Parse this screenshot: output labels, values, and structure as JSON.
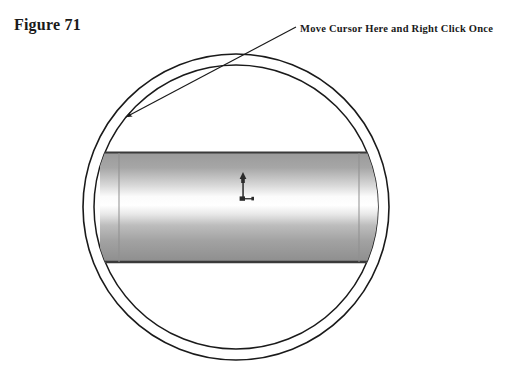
{
  "figure": {
    "label": "Figure 71"
  },
  "annotation": {
    "callout_text": "Move Cursor Here and Right Click Once",
    "arrow_target_x": 124,
    "arrow_target_y": 118,
    "arrow_origin_x": 296,
    "arrow_origin_y": 27
  },
  "drawing": {
    "title": "Pipe end view with cylinder body and CAD cursor",
    "background_color": "#ffffff",
    "line_color": "#1a1a1a",
    "annulus": {
      "name": "pipe-ring",
      "center_x": 236,
      "center_y": 207,
      "outer_radius": 153,
      "inner_radius": 142,
      "stroke_width": 1.6,
      "fill": "#ffffff"
    },
    "cylinder": {
      "name": "pipe-body",
      "left": 118,
      "right": 360,
      "top": 152,
      "bottom": 263,
      "edge_color": "#3a3a3a",
      "gradient_stops": [
        {
          "offset": "0%",
          "color": "#9a9a9a"
        },
        {
          "offset": "14%",
          "color": "#a6a6a6"
        },
        {
          "offset": "30%",
          "color": "#d8d8d8"
        },
        {
          "offset": "40%",
          "color": "#fbfbfb"
        },
        {
          "offset": "48%",
          "color": "#ffffff"
        },
        {
          "offset": "56%",
          "color": "#e8e8e8"
        },
        {
          "offset": "66%",
          "color": "#bdbdbd"
        },
        {
          "offset": "80%",
          "color": "#a2a2a2"
        },
        {
          "offset": "100%",
          "color": "#8d8d8d"
        }
      ]
    },
    "cursor": {
      "name": "cad-pick-cursor",
      "x": 243,
      "y": 172,
      "color": "#2b2b2b"
    }
  }
}
